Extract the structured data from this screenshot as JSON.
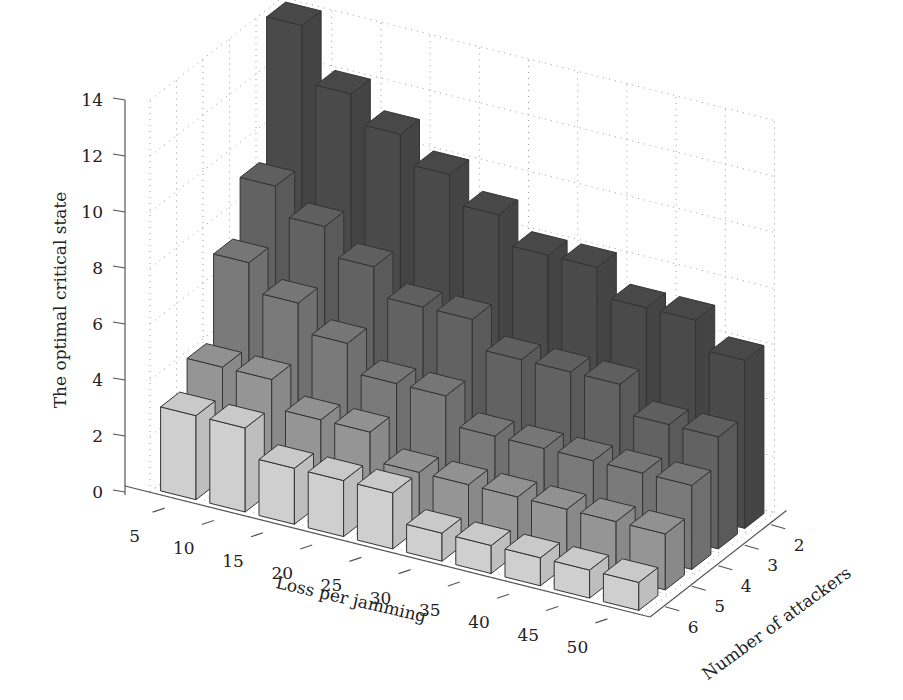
{
  "chart_data": {
    "type": "bar3d",
    "title": "",
    "xlabel": "Loss per jamming",
    "ylabel": "Number of attackers",
    "zlabel": "The optimal critical state",
    "x_categories": [
      "5",
      "10",
      "15",
      "20",
      "25",
      "30",
      "35",
      "40",
      "45",
      "50"
    ],
    "y_categories": [
      "2",
      "3",
      "4",
      "5",
      "6"
    ],
    "z_ticks": [
      "0",
      "2",
      "4",
      "6",
      "8",
      "10",
      "12",
      "14"
    ],
    "zlim": [
      0,
      14
    ],
    "grid": true,
    "series": [
      {
        "name": "2",
        "color": "#4a4a4a",
        "values": [
          14,
          12,
          11,
          10,
          9,
          8,
          8,
          7,
          7,
          6
        ]
      },
      {
        "name": "3",
        "color": "#626262",
        "values": [
          9,
          8,
          7,
          6,
          6,
          5,
          5,
          5,
          4,
          4
        ]
      },
      {
        "name": "4",
        "color": "#7a7a7a",
        "values": [
          7,
          6,
          5,
          4,
          4,
          3,
          3,
          3,
          3,
          3
        ]
      },
      {
        "name": "5",
        "color": "#959595",
        "values": [
          4,
          4,
          3,
          3,
          2,
          2,
          2,
          2,
          2,
          2
        ]
      },
      {
        "name": "6",
        "color": "#cfcfcf",
        "values": [
          3,
          3,
          2,
          2,
          2,
          1,
          1,
          1,
          1,
          1
        ]
      }
    ]
  }
}
